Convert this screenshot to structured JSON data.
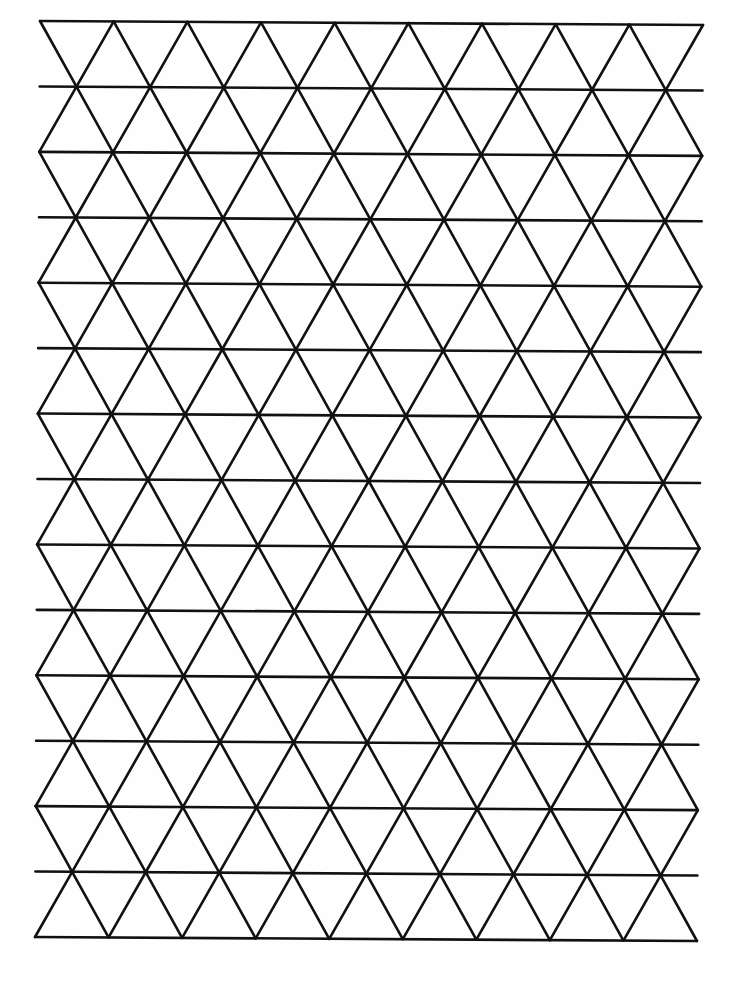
{
  "page": {
    "title": "Isometric triangle grid paper",
    "background_color": "#fefefe",
    "line_color": "#111111",
    "line_width": 2.6
  },
  "grid": {
    "type": "equilateral-triangle-grid",
    "columns": 9,
    "rows": 14,
    "corners": {
      "top_left": [
        40,
        21
      ],
      "top_right": [
        703,
        25
      ],
      "bottom_left": [
        35,
        937
      ],
      "bottom_right": [
        697,
        941
      ]
    },
    "odd_rows_offset_half": true,
    "odd_row_lines_extend_to_edge": true
  }
}
